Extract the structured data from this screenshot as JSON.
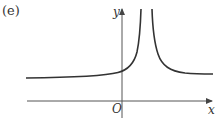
{
  "figure": {
    "panel_label": "(e)",
    "x_axis_label": "x",
    "y_axis_label": "y",
    "origin_label": "O",
    "curve_description": "Curve with vertical asymptote at positive x; tends to positive horizontal asymptote as x → ±∞, rising to +∞ on both sides of the asymptote",
    "colors": {
      "curve": "#333333",
      "axis": "#555555"
    }
  }
}
